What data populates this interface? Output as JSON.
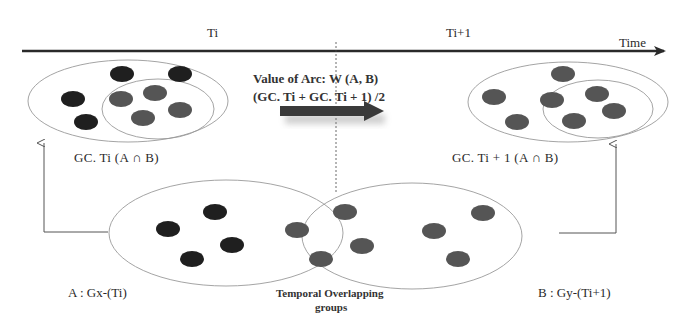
{
  "timeline": {
    "period_left": "Ti",
    "period_right": "Ti+1",
    "axis_label": "Time"
  },
  "left_snapshot": {
    "label": "GC. Ti (A ∩ B)",
    "outer_nodes": 4,
    "inner_nodes": 4
  },
  "right_snapshot": {
    "label": "GC. Ti + 1 (A ∩ B)",
    "outer_nodes": 3,
    "inner_nodes": 4
  },
  "arc": {
    "line1": "Value of Arc: W (A, B)",
    "line2": "(GC. Ti + GC. Ti + 1) /2"
  },
  "groups": {
    "a_label": "A : Gx-(Ti)",
    "b_label": "B : Gy-(Ti+1)",
    "overlap_line1": "Temporal Overlapping",
    "overlap_line2": "groups",
    "a_nodes": 4,
    "overlap_nodes": 4,
    "b_nodes": 3
  },
  "colors": {
    "dark_node": "#1f1f1f",
    "grey_node": "#555555",
    "ellipse_stroke": "#9a9a9a",
    "axis": "#2a2a2a",
    "arrow_fill": "#3a3a3a"
  }
}
